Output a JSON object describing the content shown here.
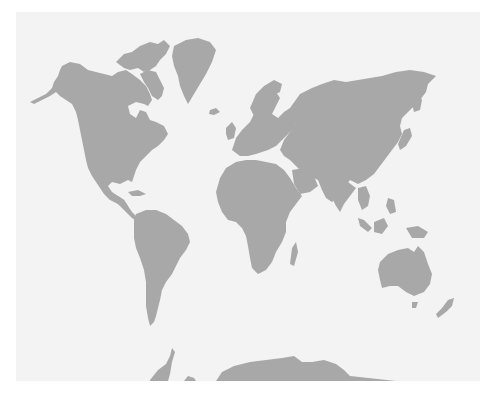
{
  "map": {
    "title": "",
    "projection": "Miller",
    "colors": {
      "land": "#a8a8a8",
      "ocean": "#f3f3f3",
      "page": "#ffffff"
    },
    "regions": [
      {
        "id": "north-america",
        "label": "North America"
      },
      {
        "id": "greenland",
        "label": "Greenland"
      },
      {
        "id": "south-america",
        "label": "South America"
      },
      {
        "id": "europe",
        "label": "Europe"
      },
      {
        "id": "africa",
        "label": "Africa"
      },
      {
        "id": "asia",
        "label": "Asia"
      },
      {
        "id": "australia",
        "label": "Australia"
      },
      {
        "id": "antarctica",
        "label": "Antarctica"
      }
    ]
  }
}
